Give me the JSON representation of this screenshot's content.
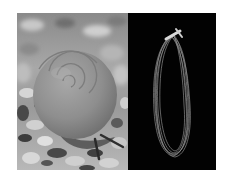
{
  "figure": {
    "layout": "two-panel side-by-side",
    "left_panel": {
      "subject": "snail with spiral shell on gravel, grayscale photograph",
      "background": "#9a9a9a"
    },
    "right_panel": {
      "subject": "loop of thin fibers/threads tied at top, on black background",
      "background": "#020202"
    },
    "colors": {
      "page_background": "#ffffff",
      "shell": "#8c8c8c",
      "shell_highlight": "#a6a6a6",
      "gravel_light": "#d0d0d0",
      "gravel_dark": "#3a3a3a",
      "fiber": "#bdbdbd"
    }
  }
}
